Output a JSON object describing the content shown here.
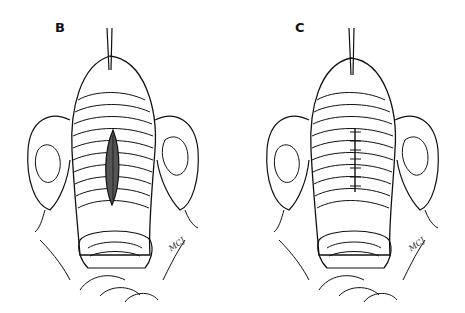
{
  "figure": {
    "panels": [
      {
        "label": "B",
        "description": "Uterus held by traction suture at fundus with vertical midline incision on anterior wall; ovaries and fallopian tubes on either side; cervix and vaginal opening below",
        "feature": "open-incision",
        "signature": "MCJ"
      },
      {
        "label": "C",
        "description": "Same view with the midline incision closed by interrupted sutures",
        "feature": "sutured-incision",
        "suture_count": 7,
        "signature": "MCJ"
      }
    ],
    "colors": {
      "ink": "#111111",
      "background": "#ffffff"
    }
  }
}
